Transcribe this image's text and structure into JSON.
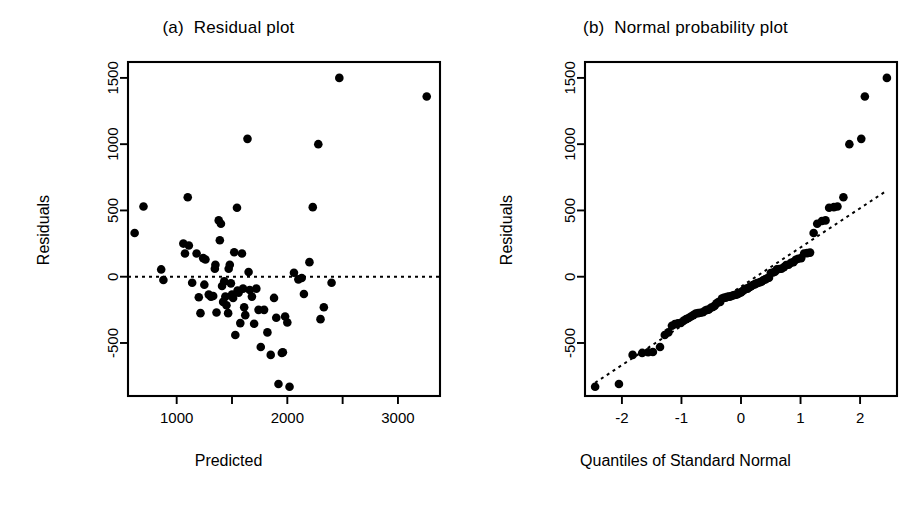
{
  "figure": {
    "background": "#ffffff",
    "foreground": "#000000",
    "width": 914,
    "height": 505
  },
  "panel_a": {
    "title": "(a)  Residual plot",
    "xlabel": "Predicted",
    "ylabel": "Residuals"
  },
  "panel_b": {
    "title": "(b)  Normal probability plot",
    "xlabel": "Quantiles of Standard Normal",
    "ylabel": "Residuals"
  },
  "chart_data": [
    {
      "type": "scatter",
      "title": "(a)  Residual plot",
      "xlabel": "Predicted",
      "ylabel": "Residuals",
      "xlim": [
        560,
        3380
      ],
      "ylim": [
        -900,
        1620
      ],
      "xticks": [
        1000,
        1500,
        2000,
        2500,
        3000
      ],
      "xtick_labels": [
        "1000",
        "",
        "2000",
        "",
        "3000"
      ],
      "yticks": [
        -500,
        0,
        500,
        1000,
        1500
      ],
      "ytick_labels": [
        "-500",
        "0",
        "500",
        "1000",
        "1500"
      ],
      "grid": false,
      "legend": "none",
      "reference_line": {
        "type": "horizontal",
        "y": 0,
        "style": "dotted"
      },
      "points": [
        [
          620,
          330
        ],
        [
          700,
          530
        ],
        [
          860,
          55
        ],
        [
          880,
          -25
        ],
        [
          1060,
          250
        ],
        [
          1075,
          175
        ],
        [
          1100,
          600
        ],
        [
          1110,
          235
        ],
        [
          1140,
          -45
        ],
        [
          1180,
          175
        ],
        [
          1200,
          -155
        ],
        [
          1215,
          -275
        ],
        [
          1240,
          140
        ],
        [
          1250,
          -60
        ],
        [
          1260,
          130
        ],
        [
          1290,
          -135
        ],
        [
          1310,
          -150
        ],
        [
          1330,
          -145
        ],
        [
          1345,
          60
        ],
        [
          1350,
          90
        ],
        [
          1360,
          -270
        ],
        [
          1380,
          425
        ],
        [
          1390,
          275
        ],
        [
          1400,
          400
        ],
        [
          1410,
          -70
        ],
        [
          1420,
          -190
        ],
        [
          1430,
          -35
        ],
        [
          1440,
          -150
        ],
        [
          1450,
          -215
        ],
        [
          1465,
          -275
        ],
        [
          1470,
          60
        ],
        [
          1480,
          90
        ],
        [
          1490,
          -50
        ],
        [
          1500,
          -135
        ],
        [
          1510,
          -160
        ],
        [
          1520,
          185
        ],
        [
          1530,
          -440
        ],
        [
          1545,
          520
        ],
        [
          1550,
          -105
        ],
        [
          1560,
          -120
        ],
        [
          1575,
          -350
        ],
        [
          1590,
          175
        ],
        [
          1600,
          -90
        ],
        [
          1610,
          -230
        ],
        [
          1620,
          -290
        ],
        [
          1640,
          1040
        ],
        [
          1650,
          35
        ],
        [
          1660,
          -100
        ],
        [
          1680,
          -150
        ],
        [
          1700,
          -355
        ],
        [
          1720,
          -90
        ],
        [
          1740,
          -250
        ],
        [
          1760,
          -530
        ],
        [
          1790,
          -250
        ],
        [
          1820,
          -420
        ],
        [
          1850,
          -590
        ],
        [
          1880,
          -160
        ],
        [
          1900,
          -310
        ],
        [
          1920,
          -810
        ],
        [
          1950,
          -575
        ],
        [
          1960,
          -570
        ],
        [
          1980,
          -300
        ],
        [
          2000,
          -345
        ],
        [
          2020,
          -830
        ],
        [
          2060,
          30
        ],
        [
          2100,
          -20
        ],
        [
          2130,
          -10
        ],
        [
          2150,
          -130
        ],
        [
          2200,
          110
        ],
        [
          2230,
          525
        ],
        [
          2280,
          1000
        ],
        [
          2300,
          -320
        ],
        [
          2330,
          -230
        ],
        [
          2400,
          -45
        ],
        [
          2470,
          1500
        ],
        [
          3260,
          1360
        ]
      ]
    },
    {
      "type": "scatter",
      "title": "(b)  Normal probability plot",
      "xlabel": "Quantiles of Standard Normal",
      "ylabel": "Residuals",
      "xlim": [
        -2.62,
        2.62
      ],
      "ylim": [
        -900,
        1620
      ],
      "xticks": [
        -2,
        -1,
        0,
        1,
        2
      ],
      "xtick_labels": [
        "-2",
        "-1",
        "0",
        "1",
        "2"
      ],
      "yticks": [
        -500,
        0,
        500,
        1000,
        1500
      ],
      "ytick_labels": [
        "-500",
        "0",
        "500",
        "1000",
        "1500"
      ],
      "grid": false,
      "legend": "none",
      "reference_line": {
        "type": "qq-line",
        "style": "dotted",
        "x1": -2.45,
        "y1": -800,
        "x2": 2.45,
        "y2": 650
      },
      "points": [
        [
          -2.45,
          -830
        ],
        [
          -2.05,
          -810
        ],
        [
          -1.82,
          -590
        ],
        [
          -1.66,
          -575
        ],
        [
          -1.56,
          -570
        ],
        [
          -1.48,
          -568
        ],
        [
          -1.36,
          -530
        ],
        [
          -1.28,
          -440
        ],
        [
          -1.22,
          -420
        ],
        [
          -1.16,
          -370
        ],
        [
          -1.11,
          -358
        ],
        [
          -1.06,
          -352
        ],
        [
          -1.01,
          -348
        ],
        [
          -0.96,
          -330
        ],
        [
          -0.92,
          -320
        ],
        [
          -0.88,
          -312
        ],
        [
          -0.84,
          -300
        ],
        [
          -0.8,
          -290
        ],
        [
          -0.76,
          -278
        ],
        [
          -0.72,
          -275
        ],
        [
          -0.68,
          -272
        ],
        [
          -0.64,
          -268
        ],
        [
          -0.6,
          -255
        ],
        [
          -0.57,
          -250
        ],
        [
          -0.54,
          -248
        ],
        [
          -0.5,
          -232
        ],
        [
          -0.47,
          -228
        ],
        [
          -0.44,
          -218
        ],
        [
          -0.41,
          -200
        ],
        [
          -0.38,
          -192
        ],
        [
          -0.35,
          -190
        ],
        [
          -0.32,
          -165
        ],
        [
          -0.29,
          -160
        ],
        [
          -0.26,
          -158
        ],
        [
          -0.23,
          -152
        ],
        [
          -0.2,
          -150
        ],
        [
          -0.17,
          -148
        ],
        [
          -0.14,
          -142
        ],
        [
          -0.11,
          -138
        ],
        [
          -0.08,
          -135
        ],
        [
          -0.05,
          -130
        ],
        [
          -0.03,
          -122
        ],
        [
          0.0,
          -118
        ],
        [
          0.03,
          -108
        ],
        [
          0.05,
          -100
        ],
        [
          0.08,
          -92
        ],
        [
          0.11,
          -90
        ],
        [
          0.14,
          -80
        ],
        [
          0.17,
          -72
        ],
        [
          0.2,
          -62
        ],
        [
          0.23,
          -58
        ],
        [
          0.26,
          -50
        ],
        [
          0.29,
          -46
        ],
        [
          0.32,
          -42
        ],
        [
          0.35,
          -35
        ],
        [
          0.38,
          -25
        ],
        [
          0.41,
          -20
        ],
        [
          0.44,
          -12
        ],
        [
          0.47,
          -8
        ],
        [
          0.5,
          28
        ],
        [
          0.54,
          32
        ],
        [
          0.57,
          38
        ],
        [
          0.6,
          55
        ],
        [
          0.64,
          58
        ],
        [
          0.68,
          60
        ],
        [
          0.72,
          72
        ],
        [
          0.76,
          88
        ],
        [
          0.8,
          90
        ],
        [
          0.84,
          105
        ],
        [
          0.88,
          110
        ],
        [
          0.92,
          128
        ],
        [
          0.96,
          135
        ],
        [
          1.01,
          140
        ],
        [
          1.06,
          175
        ],
        [
          1.11,
          178
        ],
        [
          1.16,
          182
        ],
        [
          1.22,
          330
        ],
        [
          1.28,
          400
        ],
        [
          1.36,
          420
        ],
        [
          1.42,
          425
        ],
        [
          1.48,
          520
        ],
        [
          1.56,
          525
        ],
        [
          1.62,
          530
        ],
        [
          1.72,
          600
        ],
        [
          1.82,
          1000
        ],
        [
          2.02,
          1040
        ],
        [
          2.08,
          1360
        ],
        [
          2.45,
          1500
        ]
      ]
    }
  ]
}
